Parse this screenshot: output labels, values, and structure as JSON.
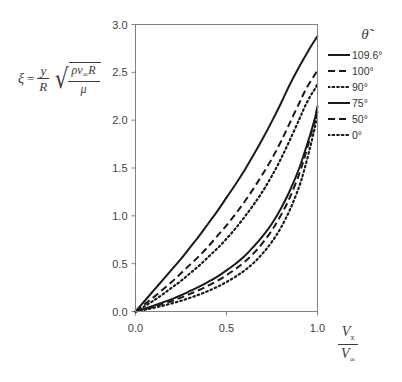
{
  "chart_data": {
    "type": "line",
    "title": "",
    "xlabel": "Vx / V∞",
    "ylabel": "ξ = (y/R)√(ρv∞R/μ)",
    "xlim": [
      0.0,
      1.0
    ],
    "ylim": [
      0.0,
      3.0
    ],
    "grid": false,
    "legend_position": "right",
    "legend_title": "θ̃",
    "x_ticks": [
      "0.0",
      "0.5",
      "1.0"
    ],
    "x_tick_values": [
      0.0,
      0.5,
      1.0
    ],
    "y_ticks": [
      "0.0",
      "0.5",
      "1.0",
      "1.5",
      "2.0",
      "2.5",
      "3.0"
    ],
    "y_tick_values": [
      0.0,
      0.5,
      1.0,
      1.5,
      2.0,
      2.5,
      3.0
    ],
    "x": [
      0.0,
      0.05,
      0.1,
      0.15,
      0.2,
      0.25,
      0.3,
      0.35,
      0.4,
      0.45,
      0.5,
      0.55,
      0.6,
      0.65,
      0.7,
      0.75,
      0.8,
      0.85,
      0.9,
      0.93,
      0.96,
      0.98,
      0.99,
      1.0
    ],
    "series": [
      {
        "name": "109.6°",
        "dash": "solid",
        "values": [
          0.0,
          0.11,
          0.22,
          0.33,
          0.44,
          0.55,
          0.67,
          0.79,
          0.92,
          1.05,
          1.19,
          1.33,
          1.48,
          1.64,
          1.81,
          1.99,
          2.18,
          2.38,
          2.56,
          2.66,
          2.76,
          2.82,
          2.85,
          2.88
        ]
      },
      {
        "name": "100°",
        "dash": "dashed",
        "values": [
          0.0,
          0.075,
          0.15,
          0.23,
          0.31,
          0.4,
          0.49,
          0.58,
          0.68,
          0.79,
          0.9,
          1.02,
          1.15,
          1.29,
          1.44,
          1.6,
          1.78,
          1.98,
          2.18,
          2.3,
          2.4,
          2.46,
          2.49,
          2.52
        ]
      },
      {
        "name": "90°",
        "dash": "dotted",
        "values": [
          0.0,
          0.055,
          0.115,
          0.18,
          0.25,
          0.32,
          0.4,
          0.48,
          0.57,
          0.66,
          0.76,
          0.87,
          0.99,
          1.12,
          1.26,
          1.42,
          1.6,
          1.8,
          2.01,
          2.14,
          2.25,
          2.31,
          2.34,
          2.38
        ]
      },
      {
        "name": "75°",
        "dash": "solid",
        "values": [
          0.0,
          0.03,
          0.06,
          0.095,
          0.13,
          0.17,
          0.215,
          0.26,
          0.31,
          0.365,
          0.43,
          0.5,
          0.58,
          0.68,
          0.79,
          0.92,
          1.08,
          1.27,
          1.5,
          1.67,
          1.85,
          1.98,
          2.05,
          2.15
        ]
      },
      {
        "name": "50°",
        "dash": "dashed",
        "values": [
          0.0,
          0.025,
          0.05,
          0.08,
          0.11,
          0.145,
          0.185,
          0.225,
          0.27,
          0.32,
          0.38,
          0.445,
          0.52,
          0.61,
          0.72,
          0.85,
          1.01,
          1.2,
          1.44,
          1.62,
          1.82,
          1.96,
          2.04,
          2.14
        ]
      },
      {
        "name": "0°",
        "dash": "dotted",
        "values": [
          0.0,
          0.018,
          0.038,
          0.06,
          0.085,
          0.112,
          0.143,
          0.177,
          0.215,
          0.258,
          0.308,
          0.365,
          0.43,
          0.51,
          0.61,
          0.73,
          0.88,
          1.07,
          1.31,
          1.5,
          1.72,
          1.88,
          1.97,
          2.1
        ]
      }
    ]
  },
  "ylabel_parts": {
    "xi": "ξ",
    "equals": "=",
    "frac_num": "y",
    "frac_den": "R",
    "radical": "√",
    "rad_num_rho": "ρ",
    "rad_num_v": "v",
    "rad_num_sub": "∞",
    "rad_num_R": "R",
    "rad_den": "μ"
  },
  "xlabel_parts": {
    "num_v": "V",
    "num_sub": "x",
    "den_v": "V",
    "den_sub": "∞"
  },
  "legend": {
    "title": "θ̃",
    "items": [
      {
        "label": "109.6°",
        "dash": "solid"
      },
      {
        "label": "100°",
        "dash": "dashed"
      },
      {
        "label": "90°",
        "dash": "dotted"
      },
      {
        "label": "75°",
        "dash": "solid"
      },
      {
        "label": "50°",
        "dash": "dashed"
      },
      {
        "label": "0°",
        "dash": "dotted"
      }
    ]
  },
  "colors": {
    "line": "#1a1a1a",
    "axis": "#808080",
    "text": "#3f3f3f",
    "background": "#ffffff"
  }
}
